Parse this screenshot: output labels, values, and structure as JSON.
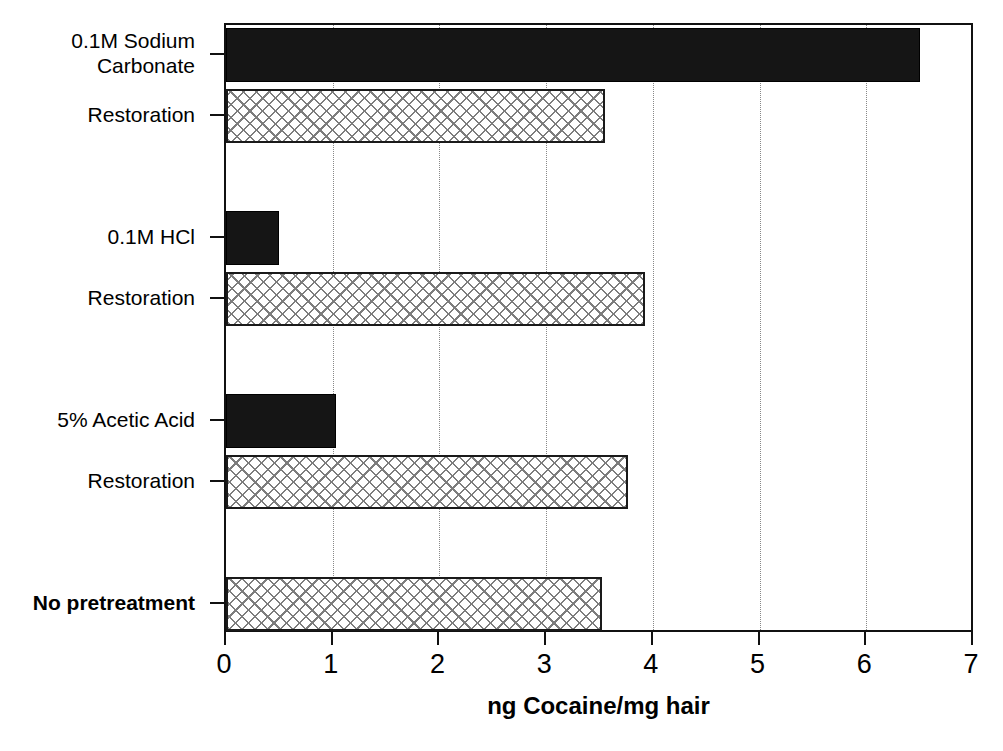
{
  "chart_data": {
    "type": "bar",
    "orientation": "horizontal",
    "title": "",
    "subtitle": "",
    "xlabel": "ng Cocaine/mg hair",
    "ylabel": "",
    "xlim": [
      0,
      7
    ],
    "xticks": [
      "0",
      "1",
      "2",
      "3",
      "4",
      "5",
      "6",
      "7"
    ],
    "grid": "vertical-dotted",
    "legend": "none",
    "categories": [
      "0.1M Sodium\nCarbonate",
      "Restoration",
      "",
      "0.1M HCl",
      "Restoration",
      "",
      "5% Acetic Acid",
      "Restoration",
      "",
      "No pretreatment"
    ],
    "bars": [
      {
        "label": "0.1M Sodium Carbonate",
        "value": 6.5,
        "style": "solid"
      },
      {
        "label": "Restoration",
        "value": 3.55,
        "style": "hatch"
      },
      {
        "label": "",
        "value": 0,
        "style": "none"
      },
      {
        "label": "0.1M HCl",
        "value": 0.5,
        "style": "solid"
      },
      {
        "label": "Restoration",
        "value": 3.93,
        "style": "hatch"
      },
      {
        "label": "",
        "value": 0,
        "style": "none"
      },
      {
        "label": "5% Acetic Acid",
        "value": 1.03,
        "style": "solid"
      },
      {
        "label": "Restoration",
        "value": 3.77,
        "style": "hatch"
      },
      {
        "label": "",
        "value": 0,
        "style": "none"
      },
      {
        "label": "No pretreatment",
        "value": 3.52,
        "style": "hatch"
      }
    ],
    "values": [
      6.5,
      3.55,
      0,
      0.5,
      3.93,
      0,
      1.03,
      3.77,
      0,
      3.52
    ],
    "colors": {
      "solid_bar": "#151515",
      "hatch_bar_line": "#7d7d7d",
      "hatch_bar_fill": "#ffffff",
      "axis": "#111111",
      "gridline": "#888888"
    }
  },
  "axis_labels": {
    "cat_0": "0.1M Sodium\nCarbonate",
    "cat_1": "Restoration",
    "cat_3": "0.1M HCl",
    "cat_4": "Restoration",
    "cat_6": "5% Acetic Acid",
    "cat_7": "Restoration",
    "cat_9": "No pretreatment",
    "x_title": "ng Cocaine/mg hair",
    "tick_0": "0",
    "tick_1": "1",
    "tick_2": "2",
    "tick_3": "3",
    "tick_4": "4",
    "tick_5": "5",
    "tick_6": "6",
    "tick_7": "7"
  }
}
